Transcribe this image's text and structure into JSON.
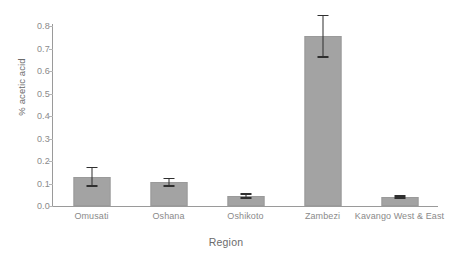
{
  "chart_data": {
    "type": "bar",
    "title": "",
    "xlabel": "Region",
    "ylabel": "% acetic acid",
    "categories": [
      "Omusati",
      "Oshana",
      "Oshikoto",
      "Zambezi",
      "Kavango West & East"
    ],
    "values": [
      0.13,
      0.105,
      0.045,
      0.755,
      0.04
    ],
    "errors_low": [
      0.045,
      0.02,
      0.012,
      0.095,
      0.007
    ],
    "errors_high": [
      0.045,
      0.02,
      0.012,
      0.095,
      0.007
    ],
    "ylim": [
      0.0,
      0.8
    ],
    "yticks": [
      "0.0",
      "0.1",
      "0.2",
      "0.3",
      "0.4",
      "0.5",
      "0.6",
      "0.7",
      "0.8"
    ],
    "ytick_values": [
      0.0,
      0.1,
      0.2,
      0.3,
      0.4,
      0.5,
      0.6,
      0.7,
      0.8
    ],
    "grid": false,
    "legend": false,
    "legend_position": "none",
    "bar_color": "#a3a3a3",
    "bar_edge_color": "#9a9a9a",
    "error_color": "#2f2f2f",
    "axis_color": "#9a9a9a",
    "text_color": "#8a8a8a",
    "title_color": "#6b6b6b",
    "background": "#ffffff"
  }
}
